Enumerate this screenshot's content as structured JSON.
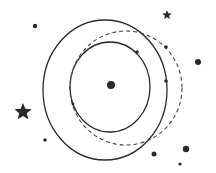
{
  "diagram": {
    "width": 216,
    "height": 173,
    "background": "#ffffff",
    "ink_color": "#2a2a2a",
    "orbits": [
      {
        "name": "outer-orbit",
        "style": "solid",
        "cx": 105,
        "cy": 90,
        "rx": 62,
        "ry": 70
      },
      {
        "name": "inner-orbit",
        "style": "solid",
        "cx": 110,
        "cy": 87,
        "rx": 40,
        "ry": 45
      },
      {
        "name": "dashed-orbit",
        "style": "dashed",
        "cx": 126,
        "cy": 88,
        "rx": 56,
        "ry": 57
      }
    ],
    "center_body": {
      "cx": 111,
      "cy": 85,
      "r": 4
    },
    "orbit_points": [
      {
        "cx": 137,
        "cy": 52,
        "r": 1.8
      },
      {
        "cx": 166,
        "cy": 47,
        "r": 1.8
      },
      {
        "cx": 166,
        "cy": 81,
        "r": 1.8
      },
      {
        "cx": 73,
        "cy": 104,
        "r": 1.4
      }
    ],
    "background_dots": [
      {
        "cx": 35,
        "cy": 26,
        "r": 2.2
      },
      {
        "cx": 198,
        "cy": 62,
        "r": 3
      },
      {
        "cx": 45,
        "cy": 140,
        "r": 1.8
      },
      {
        "cx": 154,
        "cy": 154,
        "r": 2.5
      },
      {
        "cx": 186,
        "cy": 149,
        "r": 3.2
      },
      {
        "cx": 180,
        "cy": 164,
        "r": 1.6
      }
    ],
    "stars": [
      {
        "name": "small-star",
        "cx": 167,
        "cy": 15,
        "outer": 5,
        "inner": 2.2
      },
      {
        "name": "large-star",
        "cx": 23,
        "cy": 112,
        "outer": 9,
        "inner": 4
      }
    ]
  }
}
